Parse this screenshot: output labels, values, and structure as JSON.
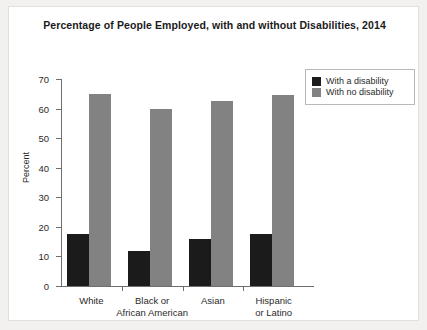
{
  "chart_data": {
    "type": "bar",
    "title": "Percentage of People Employed, with and without Disabilities, 2014",
    "xlabel": "",
    "ylabel": "Percent",
    "ylim": [
      0,
      70
    ],
    "yticks": [
      0,
      10,
      20,
      30,
      40,
      50,
      60,
      70
    ],
    "grid": false,
    "legend_position": "top-right",
    "categories": [
      "White",
      "Black or African American",
      "Asian",
      "Hispanic or Latino"
    ],
    "category_lines": [
      [
        "White"
      ],
      [
        "Black or",
        "African American"
      ],
      [
        "Asian"
      ],
      [
        "Hispanic",
        "or Latino"
      ]
    ],
    "series": [
      {
        "name": "With a disability",
        "color": "#1b1b1b",
        "values": [
          17.5,
          12,
          16,
          17.5
        ]
      },
      {
        "name": "With no disability",
        "color": "#828282",
        "values": [
          65,
          60,
          62.5,
          64.5
        ]
      }
    ]
  },
  "legend": {
    "items": [
      {
        "label": "With a disability",
        "swatch": "#1b1b1b"
      },
      {
        "label": "With no disability",
        "swatch": "#828282"
      }
    ]
  }
}
